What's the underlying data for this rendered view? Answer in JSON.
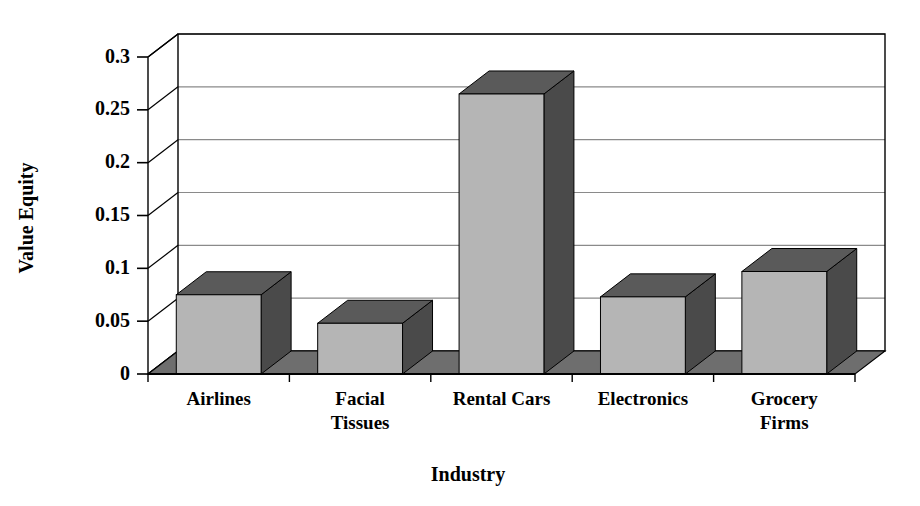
{
  "chart_data": {
    "type": "bar",
    "title": "",
    "xlabel": "Industry",
    "ylabel": "Value Equity",
    "categories": [
      "Airlines",
      "Facial Tissues",
      "Rental Cars",
      "Electronics",
      "Grocery Firms"
    ],
    "category_lines": [
      [
        "Airlines"
      ],
      [
        "Facial",
        "Tissues"
      ],
      [
        "Rental Cars"
      ],
      [
        "Electronics"
      ],
      [
        "Grocery",
        "Firms"
      ]
    ],
    "values": [
      0.075,
      0.048,
      0.265,
      0.073,
      0.097
    ],
    "ylim": [
      0,
      0.3
    ],
    "yticks": [
      0,
      0.05,
      0.1,
      0.15,
      0.2,
      0.25,
      0.3
    ],
    "ytick_labels": [
      "0",
      "0.05",
      "0.1",
      "0.15",
      "0.2",
      "0.25",
      "0.3"
    ],
    "grid": true,
    "legend": "none",
    "style": "3d-column",
    "colors": {
      "bar_front": "#b5b5b5",
      "bar_top": "#5a5a5a",
      "bar_side": "#4a4a4a",
      "floor": "#6e6e6e",
      "axis": "#000000",
      "gridline": "#8a8a8a",
      "background": "#ffffff"
    }
  }
}
